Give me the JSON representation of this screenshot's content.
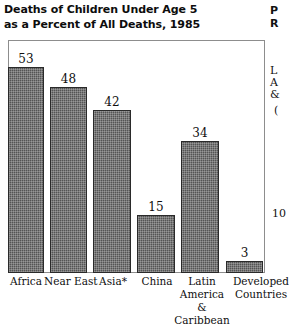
{
  "chart_data": {
    "type": "bar",
    "title": "Deaths of Children Under Age 5 as a Percent of All Deaths, 1985",
    "title_lines": [
      "Deaths of Children Under Age 5",
      "as a Percent of All Deaths, 1985"
    ],
    "categories": [
      "Africa",
      "Near East",
      "Asia*",
      "China",
      "Latin America & Caribbean",
      "Developed Countries"
    ],
    "category_lines": [
      [
        "Africa"
      ],
      [
        "Near East"
      ],
      [
        "Asia*"
      ],
      [
        "China"
      ],
      [
        "Latin",
        "America",
        "&",
        "Caribbean"
      ],
      [
        "Developed",
        "Countries"
      ]
    ],
    "values": [
      53,
      48,
      42,
      15,
      34,
      3
    ],
    "value_labels": [
      "53",
      "48",
      "42",
      "15",
      "34",
      "3"
    ],
    "xlabel": "",
    "ylabel": "",
    "ylim": [
      0,
      60
    ],
    "grid": false,
    "legend": null,
    "bar_color": "#545454",
    "bar_edge_color": "#2a2a2a",
    "frame_color": "#8d8d8d",
    "background": "#ffffff"
  },
  "edge_bleed": {
    "note": "partially clipped text from the adjacent page column",
    "fragments": [
      {
        "text": "P",
        "top": 6,
        "bold": true
      },
      {
        "text": "R",
        "top": 19,
        "bold": true
      },
      {
        "text": "L",
        "top": 66,
        "bold": false
      },
      {
        "text": "A",
        "top": 78,
        "bold": false
      },
      {
        "text": "&",
        "top": 90,
        "bold": false
      },
      {
        "text": "(",
        "top": 106,
        "bold": false
      },
      {
        "text": "10",
        "top": 209,
        "bold": false
      }
    ]
  }
}
